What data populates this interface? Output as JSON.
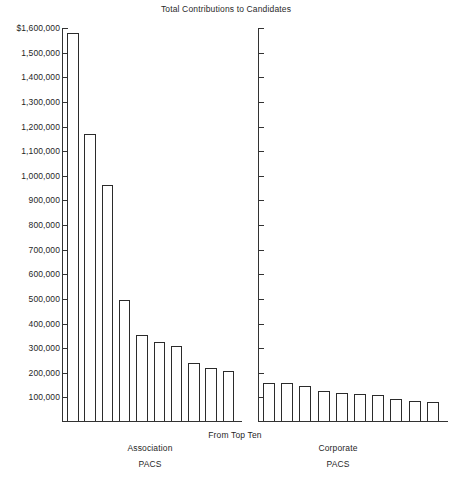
{
  "chart_data": {
    "type": "bar",
    "title": "Total Contributions to Candidates",
    "subtitle": "From Top Ten",
    "xlabel": "",
    "ylabel": "",
    "ylim": [
      0,
      1600000
    ],
    "grid": false,
    "legend": "none",
    "y_ticks": [
      "$1,600,000",
      "1,500,000",
      "1,400,000",
      "1,300,000",
      "1,200,000",
      "1,100,000",
      "1,000,000",
      "900,000",
      "800,000",
      "700,000",
      "600,000",
      "500,000",
      "400,000",
      "300,000",
      "200,000",
      "100,000"
    ],
    "y_tick_values": [
      1600000,
      1500000,
      1400000,
      1300000,
      1200000,
      1100000,
      1000000,
      900000,
      800000,
      700000,
      600000,
      500000,
      400000,
      300000,
      200000,
      100000
    ],
    "panels": [
      {
        "name": "association-pacs",
        "label_line1": "Association",
        "label_line2": "PACS",
        "categories": [
          "1",
          "2",
          "3",
          "4",
          "5",
          "6",
          "7",
          "8",
          "9",
          "10"
        ],
        "values": [
          1575000,
          1165000,
          960000,
          490000,
          350000,
          320000,
          305000,
          235000,
          215000,
          205000
        ]
      },
      {
        "name": "corporate-pacs",
        "label_line1": "Corporate",
        "label_line2": "PACS",
        "categories": [
          "1",
          "2",
          "3",
          "4",
          "5",
          "6",
          "7",
          "8",
          "9",
          "10"
        ],
        "values": [
          155000,
          155000,
          143000,
          123000,
          115000,
          110000,
          105000,
          90000,
          80000,
          78000
        ]
      }
    ],
    "colors": {
      "bar_fill": "#ffffff",
      "bar_stroke": "#2b2b2b",
      "axis": "#333333",
      "text": "#1f1f1f",
      "background": "#ffffff"
    }
  }
}
